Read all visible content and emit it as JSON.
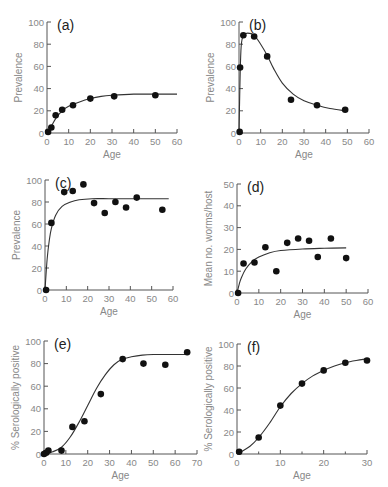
{
  "chart_data": [
    {
      "id": "a",
      "type": "scatter",
      "panel_label": "(a)",
      "xlabel": "Age",
      "ylabel": "Prevalence",
      "xlim": [
        0,
        60
      ],
      "ylim": [
        0,
        100
      ],
      "xticks": [
        0,
        10,
        20,
        30,
        40,
        50,
        60
      ],
      "yticks": [
        0,
        20,
        40,
        60,
        80,
        100
      ],
      "points": [
        [
          0.5,
          1
        ],
        [
          2,
          5
        ],
        [
          4,
          16
        ],
        [
          7,
          21
        ],
        [
          12,
          25
        ],
        [
          20,
          31
        ],
        [
          31,
          33
        ],
        [
          50,
          34
        ]
      ],
      "fit_curve": [
        [
          0,
          0
        ],
        [
          2,
          6
        ],
        [
          4,
          13
        ],
        [
          7,
          20
        ],
        [
          10,
          24
        ],
        [
          15,
          28
        ],
        [
          20,
          31
        ],
        [
          25,
          33
        ],
        [
          30,
          34
        ],
        [
          40,
          35
        ],
        [
          50,
          35
        ],
        [
          60,
          35
        ]
      ],
      "frame": {
        "x0": 47,
        "x1": 177,
        "y0": 133,
        "y1": 22
      }
    },
    {
      "id": "b",
      "type": "scatter",
      "panel_label": "(b)",
      "xlabel": "Age",
      "ylabel": "Prevalence",
      "xlim": [
        0,
        60
      ],
      "ylim": [
        0,
        100
      ],
      "xticks": [
        0,
        10,
        20,
        30,
        40,
        50,
        60
      ],
      "yticks": [
        0,
        20,
        40,
        60,
        80,
        100
      ],
      "points": [
        [
          0.3,
          1
        ],
        [
          0.5,
          59
        ],
        [
          2,
          88
        ],
        [
          7,
          87
        ],
        [
          13,
          69
        ],
        [
          24,
          30
        ],
        [
          36,
          25
        ],
        [
          49,
          21
        ]
      ],
      "fit_curve": [
        [
          0,
          0
        ],
        [
          0.5,
          50
        ],
        [
          1,
          78
        ],
        [
          2,
          88
        ],
        [
          4,
          90
        ],
        [
          7,
          88
        ],
        [
          10,
          80
        ],
        [
          13,
          70
        ],
        [
          16,
          58
        ],
        [
          20,
          45
        ],
        [
          25,
          35
        ],
        [
          30,
          29
        ],
        [
          36,
          25
        ],
        [
          42,
          22
        ],
        [
          49,
          20
        ]
      ],
      "frame": {
        "x0": 239,
        "x1": 369,
        "y0": 133,
        "y1": 22
      }
    },
    {
      "id": "c",
      "type": "scatter",
      "panel_label": "(c)",
      "xlabel": "Age",
      "ylabel": "Prevalence",
      "xlim": [
        0,
        60
      ],
      "ylim": [
        0,
        100
      ],
      "xticks": [
        0,
        10,
        20,
        30,
        40,
        50,
        60
      ],
      "yticks": [
        0,
        20,
        40,
        60,
        80,
        100
      ],
      "points": [
        [
          0.5,
          0
        ],
        [
          3,
          61
        ],
        [
          9,
          89
        ],
        [
          13,
          90
        ],
        [
          18,
          96
        ],
        [
          23,
          79
        ],
        [
          28,
          70
        ],
        [
          33,
          80
        ],
        [
          38,
          75
        ],
        [
          43,
          84
        ],
        [
          55,
          73
        ]
      ],
      "fit_curve": [
        [
          0,
          0
        ],
        [
          1,
          28
        ],
        [
          2,
          45
        ],
        [
          3,
          56
        ],
        [
          5,
          68
        ],
        [
          8,
          76
        ],
        [
          12,
          80
        ],
        [
          16,
          82
        ],
        [
          22,
          83
        ],
        [
          30,
          83
        ],
        [
          40,
          83
        ],
        [
          50,
          83
        ],
        [
          58,
          83
        ]
      ],
      "frame": {
        "x0": 45,
        "x1": 173,
        "y0": 290,
        "y1": 180
      }
    },
    {
      "id": "d",
      "type": "scatter",
      "panel_label": "(d)",
      "xlabel": "Age",
      "ylabel": "Mean no. worms/host",
      "xlim": [
        0,
        60
      ],
      "ylim": [
        0,
        50
      ],
      "xticks": [
        0,
        10,
        20,
        30,
        40,
        50,
        60
      ],
      "yticks": [
        0,
        10,
        20,
        30,
        40,
        50
      ],
      "points": [
        [
          0.5,
          0
        ],
        [
          3,
          13.5
        ],
        [
          8,
          14
        ],
        [
          13,
          21
        ],
        [
          18,
          10
        ],
        [
          23,
          23
        ],
        [
          28,
          25
        ],
        [
          33,
          24
        ],
        [
          37,
          16.5
        ],
        [
          43,
          25
        ],
        [
          50,
          16
        ]
      ],
      "fit_curve": [
        [
          0,
          0
        ],
        [
          1,
          4
        ],
        [
          2,
          7
        ],
        [
          4,
          11
        ],
        [
          7,
          14.5
        ],
        [
          10,
          16.5
        ],
        [
          15,
          18.5
        ],
        [
          20,
          19.5
        ],
        [
          30,
          20.2
        ],
        [
          40,
          20.5
        ],
        [
          50,
          20.7
        ]
      ],
      "frame": {
        "x0": 237,
        "x1": 368,
        "y0": 293,
        "y1": 184
      }
    },
    {
      "id": "e",
      "type": "scatter",
      "panel_label": "(e)",
      "xlabel": "Age",
      "ylabel": "% Serologically positive",
      "xlim": [
        0,
        70
      ],
      "ylim": [
        0,
        100
      ],
      "xticks": [
        0,
        10,
        20,
        30,
        40,
        50,
        60,
        70
      ],
      "yticks": [
        0,
        20,
        40,
        60,
        80,
        100
      ],
      "points": [
        [
          0,
          0
        ],
        [
          1,
          1
        ],
        [
          2,
          3
        ],
        [
          8,
          3
        ],
        [
          13,
          24
        ],
        [
          18.5,
          29
        ],
        [
          26,
          53
        ],
        [
          36,
          84
        ],
        [
          45.5,
          80
        ],
        [
          55.5,
          79
        ],
        [
          65.5,
          90
        ]
      ],
      "fit_curve": [
        [
          0,
          0
        ],
        [
          4,
          2
        ],
        [
          8,
          6
        ],
        [
          12,
          15
        ],
        [
          16,
          28
        ],
        [
          20,
          43
        ],
        [
          24,
          58
        ],
        [
          28,
          70
        ],
        [
          32,
          79
        ],
        [
          36,
          84
        ],
        [
          40,
          86
        ],
        [
          45,
          87.5
        ],
        [
          50,
          88
        ],
        [
          60,
          88
        ],
        [
          66,
          88
        ]
      ],
      "frame": {
        "x0": 44,
        "x1": 197,
        "y0": 454,
        "y1": 341
      }
    },
    {
      "id": "f",
      "type": "line",
      "panel_label": "(f)",
      "xlabel": "Age",
      "ylabel": "% Serologically positive",
      "xlim": [
        0,
        30
      ],
      "ylim": [
        0,
        100
      ],
      "xticks": [
        0,
        10,
        20,
        30
      ],
      "minor_xticks": [
        5,
        15,
        25
      ],
      "yticks": [
        0,
        20,
        40,
        60,
        80,
        100
      ],
      "points": [
        [
          0.5,
          2
        ],
        [
          5,
          15
        ],
        [
          10,
          44
        ],
        [
          15,
          64
        ],
        [
          20,
          76
        ],
        [
          25,
          83
        ],
        [
          30,
          85
        ]
      ],
      "fit_curve": [
        [
          0.5,
          1
        ],
        [
          3,
          7
        ],
        [
          5,
          15
        ],
        [
          7.5,
          28
        ],
        [
          10,
          43
        ],
        [
          12.5,
          55
        ],
        [
          15,
          64
        ],
        [
          17.5,
          71
        ],
        [
          20,
          76
        ],
        [
          22.5,
          80
        ],
        [
          25,
          83
        ],
        [
          27.5,
          85
        ],
        [
          30,
          86.5
        ]
      ],
      "frame": {
        "x0": 237,
        "x1": 367,
        "y0": 454,
        "y1": 344
      }
    }
  ]
}
